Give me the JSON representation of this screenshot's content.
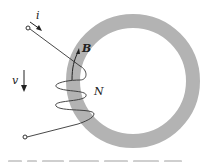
{
  "diagram": {
    "type": "toroidal-core-with-coil",
    "labels": {
      "current": "i",
      "flux_density": "B",
      "turns": "N",
      "voltage": "v"
    },
    "colors": {
      "core": "#b3b3b3",
      "wire": "#333333",
      "background": "#ffffff"
    },
    "caption_visible": false
  }
}
